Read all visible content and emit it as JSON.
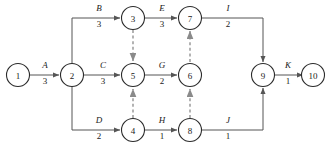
{
  "diagram": {
    "colors": {
      "background": "#ffffff",
      "node_stroke": "#2b2b2b",
      "solid_edge": "#555555",
      "dashed_edge": "#8a8a8a",
      "text": "#1a1a1a"
    },
    "nodes": [
      {
        "id": "1",
        "label": "1",
        "x": 18,
        "y": 75
      },
      {
        "id": "2",
        "label": "2",
        "x": 72,
        "y": 75
      },
      {
        "id": "3",
        "label": "3",
        "x": 133,
        "y": 18
      },
      {
        "id": "4",
        "label": "4",
        "x": 133,
        "y": 130
      },
      {
        "id": "5",
        "label": "5",
        "x": 133,
        "y": 75
      },
      {
        "id": "6",
        "label": "6",
        "x": 190,
        "y": 75
      },
      {
        "id": "7",
        "label": "7",
        "x": 190,
        "y": 18
      },
      {
        "id": "8",
        "label": "8",
        "x": 190,
        "y": 130
      },
      {
        "id": "9",
        "label": "9",
        "x": 263,
        "y": 75
      },
      {
        "id": "10",
        "label": "10",
        "x": 313,
        "y": 75
      }
    ],
    "activities": [
      {
        "name": "A",
        "duration": "3",
        "from": "1",
        "to": "2",
        "style": "solid",
        "label_x": 45,
        "label_y": 68,
        "dur_x": 45,
        "dur_y": 84
      },
      {
        "name": "B",
        "duration": "3",
        "from": "2",
        "to": "3",
        "style": "solid",
        "label_x": 99,
        "label_y": 11,
        "dur_x": 99,
        "dur_y": 27
      },
      {
        "name": "C",
        "duration": "3",
        "from": "2",
        "to": "5",
        "style": "solid",
        "label_x": 103,
        "label_y": 68,
        "dur_x": 103,
        "dur_y": 84
      },
      {
        "name": "D",
        "duration": "2",
        "from": "2",
        "to": "4",
        "style": "solid",
        "label_x": 99,
        "label_y": 123,
        "dur_x": 99,
        "dur_y": 139
      },
      {
        "name": "E",
        "duration": "3",
        "from": "3",
        "to": "7",
        "style": "solid",
        "label_x": 162,
        "label_y": 11,
        "dur_x": 162,
        "dur_y": 27
      },
      {
        "name": "G",
        "duration": "2",
        "from": "5",
        "to": "6",
        "style": "solid",
        "label_x": 162,
        "label_y": 68,
        "dur_x": 162,
        "dur_y": 84
      },
      {
        "name": "H",
        "duration": "1",
        "from": "4",
        "to": "8",
        "style": "solid",
        "label_x": 162,
        "label_y": 123,
        "dur_x": 162,
        "dur_y": 139
      },
      {
        "name": "I",
        "duration": "2",
        "from": "7",
        "to": "9",
        "style": "solid",
        "label_x": 228,
        "label_y": 11,
        "dur_x": 228,
        "dur_y": 27
      },
      {
        "name": "J",
        "duration": "1",
        "from": "8",
        "to": "9",
        "style": "solid",
        "label_x": 228,
        "label_y": 123,
        "dur_x": 228,
        "dur_y": 139
      },
      {
        "name": "K",
        "duration": "1",
        "from": "9",
        "to": "10",
        "style": "solid",
        "label_x": 288,
        "label_y": 68,
        "dur_x": 288,
        "dur_y": 84
      }
    ],
    "dummy_activities": [
      {
        "from": "3",
        "to": "5",
        "style": "dashed"
      },
      {
        "from": "4",
        "to": "5",
        "style": "dashed"
      },
      {
        "from": "8",
        "to": "6",
        "style": "dashed"
      },
      {
        "from": "6",
        "to": "7",
        "style": "dashed"
      }
    ]
  }
}
